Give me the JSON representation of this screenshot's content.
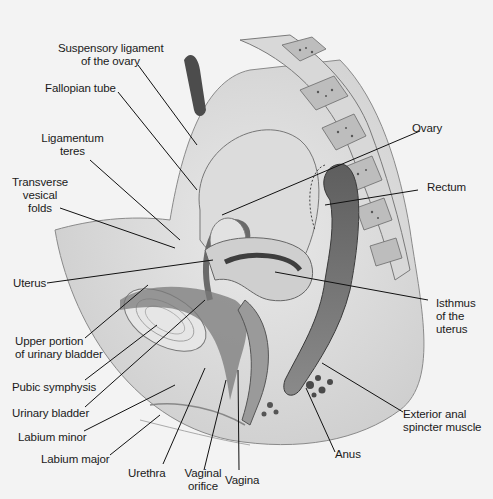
{
  "diagram": {
    "type": "anatomical-sagittal-section",
    "colors": {
      "background": "#f3f3f3",
      "tissue_light": "#e4e4e4",
      "tissue_mid": "#b9b9b9",
      "tissue_dark": "#5a5a5a",
      "rectum": "#6e6e6e",
      "leader_line": "#111111",
      "label_text": "#1a1a1a"
    },
    "labels": {
      "suspensory_ligament": {
        "line1": "Suspensory ligament",
        "line2": "of the ovary"
      },
      "fallopian_tube": "Fallopian tube",
      "ligamentum_teres": {
        "line1": "Ligamentum",
        "line2": "teres"
      },
      "transverse_vesical_folds": {
        "line1": "Transverse",
        "line2": "vesical",
        "line3": "folds"
      },
      "ovary": "Ovary",
      "rectum": "Rectum",
      "uterus": "Uterus",
      "isthmus": {
        "line1": "Isthmus",
        "line2": "of the",
        "line3": "uterus"
      },
      "upper_bladder": {
        "line1": "Upper portion",
        "line2": "of urinary bladder"
      },
      "pubic_symphysis": "Pubic symphysis",
      "urinary_bladder": "Urinary bladder",
      "labium_minor": "Labium minor",
      "labium_major": "Labium major",
      "urethra": "Urethra",
      "vaginal_orifice": {
        "line1": "Vaginal",
        "line2": "orifice"
      },
      "vagina": "Vagina",
      "anus": "Anus",
      "exterior_anal": {
        "line1": "Exterior anal",
        "line2": "spincter muscle"
      }
    }
  }
}
